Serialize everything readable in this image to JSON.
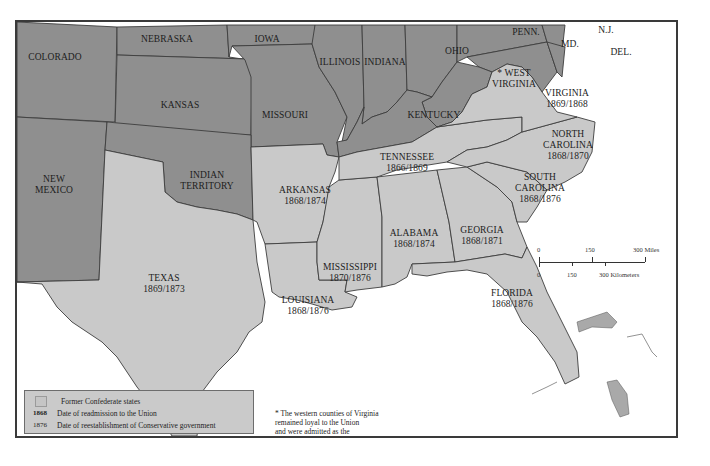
{
  "map": {
    "union_color": "#8f8f8f",
    "confederate_color": "#c9c9c9",
    "water_color": "#ffffff",
    "states": [
      {
        "id": "colorado",
        "name": "COLORADO",
        "group": "union"
      },
      {
        "id": "nebraska",
        "name": "NEBRASKA",
        "group": "union"
      },
      {
        "id": "iowa",
        "name": "IOWA",
        "group": "union"
      },
      {
        "id": "illinois",
        "name": "ILLINOIS",
        "group": "union"
      },
      {
        "id": "indiana",
        "name": "INDIANA",
        "group": "union"
      },
      {
        "id": "ohio",
        "name": "OHIO",
        "group": "union"
      },
      {
        "id": "penn",
        "name": "PENN.",
        "group": "union"
      },
      {
        "id": "nj",
        "name": "N.J.",
        "group": "union"
      },
      {
        "id": "md",
        "name": "MD.",
        "group": "union"
      },
      {
        "id": "del",
        "name": "DEL.",
        "group": "union"
      },
      {
        "id": "kansas",
        "name": "KANSAS",
        "group": "union"
      },
      {
        "id": "missouri",
        "name": "MISSOURI",
        "group": "union"
      },
      {
        "id": "kentucky",
        "name": "KENTUCKY",
        "group": "union"
      },
      {
        "id": "west-virginia",
        "name": "* WEST VIRGINIA",
        "line1": "* WEST",
        "line2": "VIRGINIA",
        "group": "union"
      },
      {
        "id": "new-mexico",
        "name": "NEW MEXICO",
        "line1": "NEW",
        "line2": "MEXICO",
        "group": "union"
      },
      {
        "id": "indian-territory",
        "name": "INDIAN TERRITORY",
        "line1": "INDIAN",
        "line2": "TERRITORY",
        "group": "union"
      },
      {
        "id": "virginia",
        "name": "VIRGINIA",
        "dates": "1869/1868",
        "group": "confederate"
      },
      {
        "id": "north-carolina",
        "name": "NORTH CAROLINA",
        "line1": "NORTH",
        "line2": "CAROLINA",
        "dates": "1868/1870",
        "group": "confederate"
      },
      {
        "id": "tennessee",
        "name": "TENNESSEE",
        "dates": "1866/1869",
        "group": "confederate"
      },
      {
        "id": "south-carolina",
        "name": "SOUTH CAROLINA",
        "line1": "SOUTH",
        "line2": "CAROLINA",
        "dates": "1868/1876",
        "group": "confederate"
      },
      {
        "id": "arkansas",
        "name": "ARKANSAS",
        "dates": "1868/1874",
        "group": "confederate"
      },
      {
        "id": "alabama",
        "name": "ALABAMA",
        "dates": "1868/1874",
        "group": "confederate"
      },
      {
        "id": "georgia",
        "name": "GEORGIA",
        "dates": "1868/1871",
        "group": "confederate"
      },
      {
        "id": "mississippi",
        "name": "MISSISSIPPI",
        "dates": "1870/1876",
        "group": "confederate"
      },
      {
        "id": "texas",
        "name": "TEXAS",
        "dates": "1869/1873",
        "group": "confederate"
      },
      {
        "id": "louisiana",
        "name": "LOUISIANA",
        "dates": "1868/1876",
        "group": "confederate"
      },
      {
        "id": "florida",
        "name": "FLORIDA",
        "dates": "1868/1876",
        "group": "confederate"
      }
    ]
  },
  "legend": {
    "items": [
      {
        "swatch": true,
        "label": "Former Confederate states"
      },
      {
        "year": "1868",
        "label": "Date of readmission to the Union"
      },
      {
        "year": "1876",
        "label": "Date of reestablishment of Conservative government"
      }
    ]
  },
  "footnote": {
    "lines": [
      "* The western counties of Virginia",
      "remained loyal to the Union",
      "and were admitted as the",
      "state of West Virginia in 1863"
    ]
  },
  "scale": {
    "miles": [
      "0",
      "150",
      "300 Miles"
    ],
    "kilometers": [
      "0",
      "150",
      "300 Kilometers"
    ]
  }
}
